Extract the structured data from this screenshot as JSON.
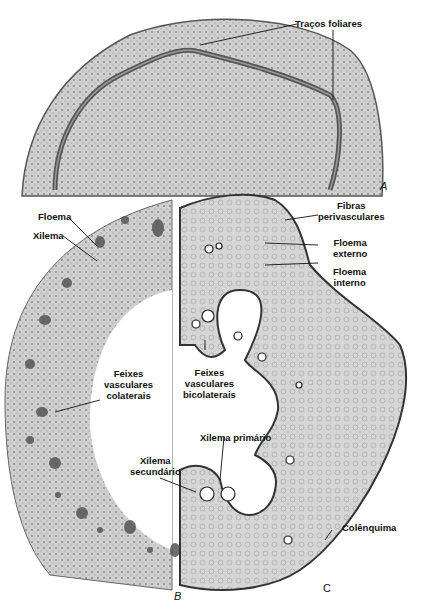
{
  "figure": {
    "panels": [
      {
        "id": "A",
        "letter": "A",
        "description": "Cross section of stem showing leaf traces"
      },
      {
        "id": "B",
        "letter": "B",
        "description": "Stem section with collateral vascular bundles"
      },
      {
        "id": "C",
        "letter": "C",
        "description": "Stem section with bicollateral vascular bundles"
      }
    ],
    "labels": {
      "tracos_foliares": "Traços foliares",
      "floema": "Floema",
      "xilema": "Xilema",
      "fibras_1": "Fibras",
      "fibras_2": "perivasculares",
      "floema_externo_1": "Floema",
      "floema_externo_2": "externo",
      "floema_interno_1": "Floema",
      "floema_interno_2": "interno",
      "feixes_col_1": "Feixes",
      "feixes_col_2": "vasculares",
      "feixes_col_3": "colaterais",
      "feixes_bicol_1": "Feixes",
      "feixes_bicol_2": "vasculares",
      "feixes_bicol_3": "bicolaterais",
      "xilema_primario": "Xilema primário",
      "xilema_sec_1": "Xilema",
      "xilema_sec_2": "secundário",
      "colenquima": "Colênquima"
    },
    "colors": {
      "tissue": "#c9c9c9",
      "tissue_dark": "#6a6a6a",
      "outline": "#333333",
      "background": "#ffffff"
    }
  }
}
